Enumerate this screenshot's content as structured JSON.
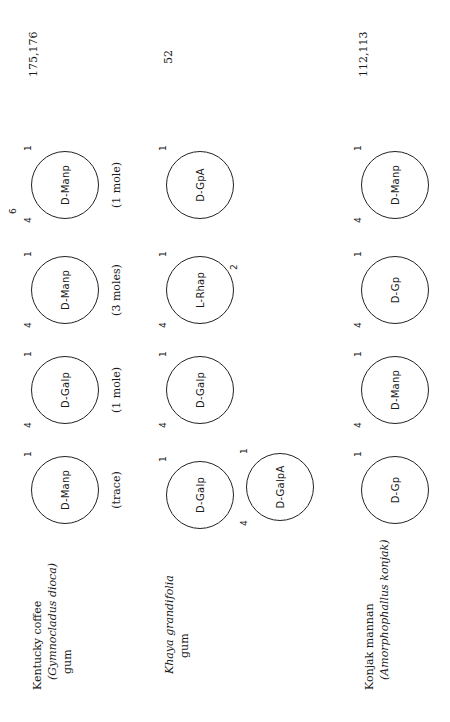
{
  "rows": [
    {
      "source_line1": "Kentucky coffee",
      "source_line2": "(Gymnocladus dioca)",
      "source_line3": "gum",
      "reference": "175,176",
      "units": [
        {
          "sugar": "D-Manp",
          "quantity": "(trace)",
          "positions": [
            "1"
          ]
        },
        {
          "sugar": "D-Galp",
          "quantity": "(1 mole)",
          "positions": [
            "4",
            "1"
          ]
        },
        {
          "sugar": "D-Manp",
          "quantity": "(3 moles)",
          "positions": [
            "4",
            "1"
          ]
        },
        {
          "sugar": "D-Manp",
          "quantity": "(1 mole)",
          "positions": [
            "4",
            "6",
            "1"
          ]
        }
      ]
    },
    {
      "source_line1": "Khaya grandifolia",
      "source_line2": "gum",
      "reference": "52",
      "units": [
        {
          "sugar": "D-Galp",
          "positions": [
            "1"
          ]
        },
        {
          "sugar": "D-Galp",
          "positions": [
            "4",
            "1"
          ]
        },
        {
          "sugar": "L-Rhap",
          "positions": [
            "4",
            "2",
            "1"
          ]
        },
        {
          "sugar": "D-GpA",
          "positions": [
            "1"
          ]
        }
      ],
      "branch_unit": {
        "sugar": "D-GalpA",
        "positions": [
          "4",
          "1"
        ]
      }
    },
    {
      "source_line1": "Konjak mannan",
      "source_line2": "(Amorphophallus konjak)",
      "reference": "112,113",
      "units": [
        {
          "sugar": "D-Gp",
          "positions": [
            "1"
          ]
        },
        {
          "sugar": "D-Manp",
          "positions": [
            "4",
            "1"
          ]
        },
        {
          "sugar": "D-Gp",
          "positions": [
            "4",
            "1"
          ]
        },
        {
          "sugar": "D-Manp",
          "positions": [
            "4",
            "1"
          ]
        }
      ]
    }
  ]
}
